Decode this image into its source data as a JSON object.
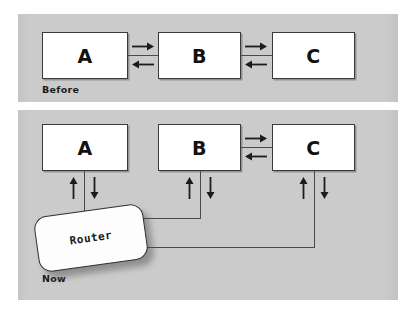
{
  "figure": {
    "background_color": "#ffffff",
    "panel_color": "#c9c9c9",
    "node_fill": "#ffffff",
    "node_stroke": "#3a3a3a",
    "line_color": "#4a4a4a"
  },
  "panels": [
    {
      "id": "before",
      "caption": "Before",
      "nodes": [
        {
          "id": "a",
          "label": "A"
        },
        {
          "id": "b",
          "label": "B"
        },
        {
          "id": "c",
          "label": "C"
        }
      ],
      "connections": [
        {
          "from": "A",
          "to": "B",
          "direction": "bidirectional"
        },
        {
          "from": "B",
          "to": "C",
          "direction": "bidirectional"
        }
      ]
    },
    {
      "id": "now",
      "caption": "Now",
      "nodes": [
        {
          "id": "a",
          "label": "A"
        },
        {
          "id": "b",
          "label": "B"
        },
        {
          "id": "c",
          "label": "C"
        },
        {
          "id": "router",
          "label": "Router"
        }
      ],
      "connections": [
        {
          "from": "B",
          "to": "C",
          "direction": "bidirectional"
        },
        {
          "from": "A",
          "to": "Router",
          "direction": "bidirectional"
        },
        {
          "from": "B",
          "to": "Router",
          "direction": "bidirectional"
        },
        {
          "from": "C",
          "to": "Router",
          "direction": "bidirectional"
        }
      ]
    }
  ],
  "arrow_glyphs": {
    "right": "arrow-right",
    "left": "arrow-left",
    "up": "arrow-up",
    "down": "arrow-down"
  }
}
